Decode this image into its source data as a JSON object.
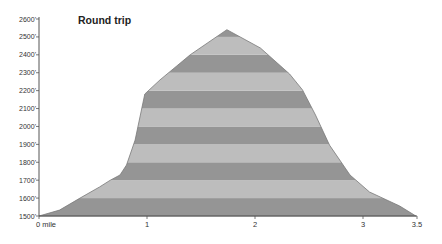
{
  "chart_data": {
    "type": "area",
    "title": "Round trip",
    "xlabel": "",
    "ylabel": "",
    "x_unit_label": "mile",
    "xlim": [
      0,
      3.5
    ],
    "ylim": [
      1500,
      2600
    ],
    "x_ticks": [
      0,
      1,
      2,
      3,
      3.5
    ],
    "x_tick_labels": [
      "0 mile",
      "1",
      "2",
      "3",
      "3.5"
    ],
    "y_ticks": [
      1500,
      1600,
      1700,
      1800,
      1900,
      2000,
      2100,
      2200,
      2300,
      2400,
      2500,
      2600
    ],
    "y_tick_labels": [
      "1500'",
      "1600'",
      "1700'",
      "1800'",
      "1900'",
      "2000'",
      "2100'",
      "2200'",
      "2300'",
      "2400'",
      "2500'",
      "2600'"
    ],
    "grid": false,
    "legend": null,
    "band_colors": {
      "dark": "#959595",
      "light": "#bdbdbd",
      "outline": "#7a7a7a"
    },
    "series": [
      {
        "name": "Elevation profile",
        "x": [
          0,
          0.19,
          0.38,
          0.56,
          0.66,
          0.75,
          0.81,
          0.89,
          0.98,
          1.12,
          1.4,
          1.74,
          2.05,
          2.32,
          2.44,
          2.56,
          2.69,
          2.88,
          3.06,
          3.34,
          3.49
        ],
        "y": [
          1500,
          1533,
          1600,
          1662,
          1700,
          1729,
          1785,
          1924,
          2181,
          2260,
          2400,
          2540,
          2438,
          2293,
          2204,
          2064,
          1896,
          1729,
          1634,
          1556,
          1500
        ]
      }
    ],
    "annotations": []
  }
}
